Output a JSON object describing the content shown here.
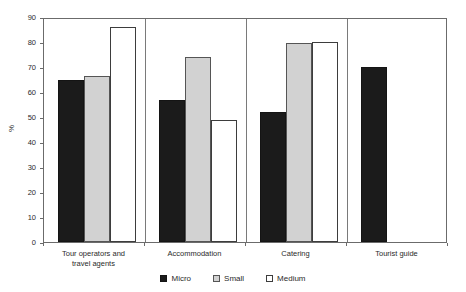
{
  "chart_data": {
    "type": "bar",
    "title": "",
    "xlabel": "",
    "ylabel": "%",
    "ylim": [
      0,
      90
    ],
    "ytick_step": 10,
    "yticks": [
      90,
      80,
      70,
      60,
      50,
      40,
      30,
      20,
      10,
      0
    ],
    "grid": false,
    "legend_position": "bottom-center",
    "categories": [
      "Tour operators and travel agents",
      "Accommodation",
      "Catering",
      "Tourist guide"
    ],
    "category_lines": [
      [
        "Tour operators and",
        "travel agents"
      ],
      [
        "Accommodation"
      ],
      [
        "Catering"
      ],
      [
        "Tourist guide"
      ]
    ],
    "series": [
      {
        "name": "Micro",
        "color": "#1b1b1b",
        "values": [
          65,
          57,
          52,
          70
        ]
      },
      {
        "name": "Small",
        "color": "#d2d2d2",
        "values": [
          66.5,
          74,
          79.5,
          null
        ]
      },
      {
        "name": "Medium",
        "color": "#ffffff",
        "values": [
          86,
          48.8,
          80.2,
          null
        ]
      }
    ]
  },
  "legend": {
    "items": [
      {
        "label": "Micro",
        "swatch": "legend-swatch-micro"
      },
      {
        "label": "Small",
        "swatch": "legend-swatch-small"
      },
      {
        "label": "Medium",
        "swatch": "legend-swatch-medium"
      }
    ]
  },
  "axis": {
    "y_label": "%",
    "y_ticks": [
      "90",
      "80",
      "70",
      "60",
      "50",
      "40",
      "30",
      "20",
      "10",
      "0"
    ]
  }
}
